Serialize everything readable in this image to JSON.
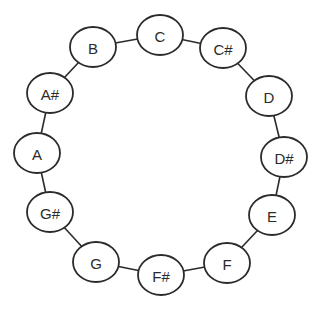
{
  "diagram": {
    "type": "circular-graph",
    "node_style": {
      "shape": "ellipse",
      "rx": 23,
      "ry": 20,
      "fill": "#ffffff",
      "stroke": "#2b2b2b"
    },
    "edge_color": "#2b2b2b",
    "nodes": [
      {
        "id": "C",
        "label": "C",
        "x": 160,
        "y": 35
      },
      {
        "id": "Cs",
        "label": "C#",
        "x": 223,
        "y": 48
      },
      {
        "id": "D",
        "label": "D",
        "x": 269,
        "y": 96
      },
      {
        "id": "Ds",
        "label": "D#",
        "x": 284,
        "y": 157
      },
      {
        "id": "E",
        "label": "E",
        "x": 272,
        "y": 215
      },
      {
        "id": "F",
        "label": "F",
        "x": 227,
        "y": 263
      },
      {
        "id": "Fs",
        "label": "F#",
        "x": 161,
        "y": 275
      },
      {
        "id": "G",
        "label": "G",
        "x": 96,
        "y": 262
      },
      {
        "id": "Gs",
        "label": "G#",
        "x": 50,
        "y": 212
      },
      {
        "id": "A",
        "label": "A",
        "x": 37,
        "y": 153
      },
      {
        "id": "As",
        "label": "A#",
        "x": 50,
        "y": 93
      },
      {
        "id": "B",
        "label": "B",
        "x": 93,
        "y": 47
      }
    ],
    "edges": [
      [
        "C",
        "Cs"
      ],
      [
        "Cs",
        "D"
      ],
      [
        "D",
        "Ds"
      ],
      [
        "Ds",
        "E"
      ],
      [
        "E",
        "F"
      ],
      [
        "F",
        "Fs"
      ],
      [
        "Fs",
        "G"
      ],
      [
        "G",
        "Gs"
      ],
      [
        "Gs",
        "A"
      ],
      [
        "A",
        "As"
      ],
      [
        "As",
        "B"
      ],
      [
        "B",
        "C"
      ]
    ]
  }
}
